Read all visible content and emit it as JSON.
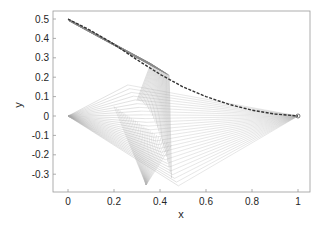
{
  "chart_data": {
    "type": "line",
    "title": "",
    "xlabel": "x",
    "ylabel": "y",
    "xlim": [
      -0.05,
      1.05
    ],
    "ylim": [
      -0.4,
      0.55
    ],
    "xticks": [
      0,
      0.2,
      0.4,
      0.6,
      0.8,
      1
    ],
    "xtick_labels": [
      "0",
      "0.2",
      "0.4",
      "0.6",
      "0.8",
      "1"
    ],
    "yticks": [
      -0.3,
      -0.2,
      -0.1,
      0,
      0.1,
      0.2,
      0.3,
      0.4,
      0.5
    ],
    "ytick_labels": [
      "-0.3",
      "-0.2",
      "-0.1",
      "0",
      "0.1",
      "0.2",
      "0.3",
      "0.4",
      "0.5"
    ],
    "grid": false,
    "legend": null,
    "key_points": {
      "top_left": [
        0,
        0.5
      ],
      "origin": [
        0,
        0
      ],
      "end": [
        1,
        0
      ],
      "upper_knee": [
        0.43,
        0.23
      ],
      "bottom_vertex": [
        0.34,
        -0.355
      ]
    },
    "series": [
      {
        "name": "dashed-trajectory",
        "style": "dashed-dark",
        "x": [
          0,
          0.1,
          0.2,
          0.3,
          0.4,
          0.5,
          0.6,
          0.7,
          0.8,
          0.9,
          1.0
        ],
        "y": [
          0.5,
          0.44,
          0.37,
          0.29,
          0.215,
          0.15,
          0.1,
          0.06,
          0.03,
          0.01,
          0
        ]
      }
    ]
  }
}
